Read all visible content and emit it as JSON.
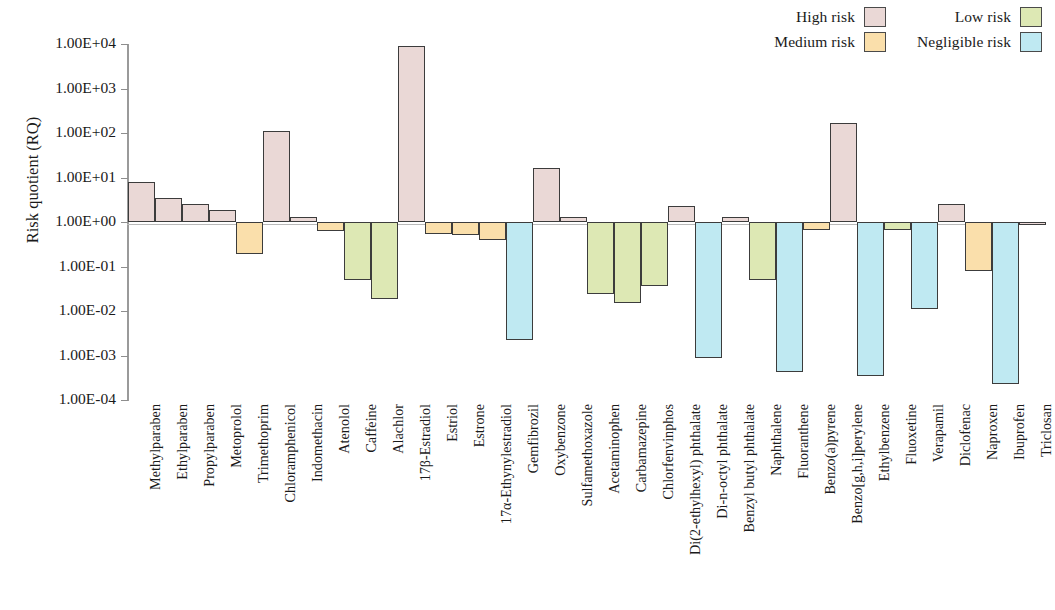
{
  "chart": {
    "type": "bar",
    "ylabel": "Risk quotient (RQ)",
    "xlabel": "",
    "title": ""
  },
  "legend": {
    "rows": [
      [
        {
          "label": "High risk",
          "color": "#ead8d6"
        },
        {
          "label": "Low risk",
          "color": "#dde8b4"
        }
      ],
      [
        {
          "label": "Medium risk",
          "color": "#fadfab"
        },
        {
          "label": "Negligible risk",
          "color": "#bfe9f2"
        }
      ]
    ]
  },
  "yaxis": {
    "ticks": [
      "1.00E+04",
      "1.00E+03",
      "1.00E+02",
      "1.00E+01",
      "1.00E+00",
      "1.00E-01",
      "1.00E-02",
      "1.00E-03",
      "1.00E-04"
    ],
    "min_exp": -4,
    "max_exp": 4
  },
  "chart_data": {
    "type": "bar",
    "title": "",
    "xlabel": "",
    "ylabel": "Risk quotient (RQ)",
    "scale": "log10",
    "ylim": [
      0.0001,
      10000
    ],
    "grid": false,
    "legend_position": "top-right",
    "baseline": 1,
    "categories": [
      "Methylparaben",
      "Ethylparaben",
      "Propylparaben",
      "Metoprolol",
      "Trimethoprim",
      "Chloramphenicol",
      "Indomethacin",
      "Atenolol",
      "Caffeine",
      "Alachlor",
      "17β-Estradiol",
      "Estriol",
      "Estrone",
      "17α-Ethynylestradiol",
      "Gemfibrozil",
      "Oxybenzone",
      "Sulfamethoxazole",
      "Acetaminophen",
      "Carbamazepine",
      "Chlorfenvinphos",
      "Di(2-ethylhexyl) phthalate",
      "Di-n-octyl phthalate",
      "Benzyl butyl phthalate",
      "Naphthalene",
      "Fluoranthene",
      "Benzo(a)pyrene",
      "Benzo[g,h,i]perylene",
      "Ethylbenzene",
      "Fluoxetine",
      "Verapamil",
      "Diclofenac",
      "Naproxen",
      "Ibuprofen",
      "Triclosan"
    ],
    "values": [
      8.0,
      3.5,
      2.5,
      1.9,
      0.19,
      110,
      1.3,
      0.63,
      0.05,
      0.019,
      8800,
      0.55,
      0.5,
      0.4,
      0.0022,
      16,
      1.3,
      0.024,
      0.015,
      0.036,
      2.3,
      0.0009,
      1.3,
      0.05,
      0.00043,
      0.65,
      170,
      0.00035,
      0.65,
      0.011,
      2.5,
      0.08,
      0.00023,
      0.85
    ],
    "risk_class": [
      "high",
      "high",
      "high",
      "high",
      "medium",
      "high",
      "high",
      "medium",
      "low",
      "low",
      "high",
      "medium",
      "medium",
      "medium",
      "negligible",
      "high",
      "high",
      "low",
      "low",
      "low",
      "high",
      "negligible",
      "high",
      "low",
      "negligible",
      "medium",
      "high",
      "negligible",
      "low",
      "negligible",
      "high",
      "medium",
      "negligible",
      "high"
    ],
    "class_colors": {
      "high": "#ead8d6",
      "medium": "#fadfab",
      "low": "#dde8b4",
      "negligible": "#bfe9f2"
    },
    "class_labels": {
      "high": "High risk",
      "medium": "Medium risk",
      "low": "Low risk",
      "negligible": "Negligible risk"
    }
  }
}
